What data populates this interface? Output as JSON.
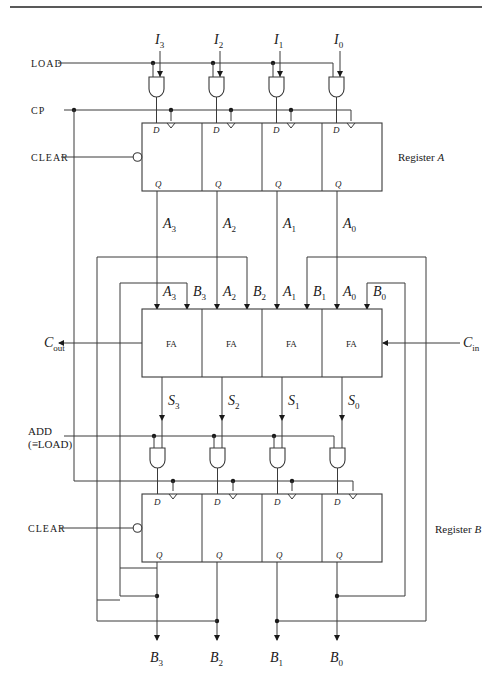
{
  "figure": {
    "top_rule": true
  },
  "inputs": {
    "I3": {
      "base": "I",
      "sub": "3"
    },
    "I2": {
      "base": "I",
      "sub": "2"
    },
    "I1": {
      "base": "I",
      "sub": "1"
    },
    "I0": {
      "base": "I",
      "sub": "0"
    }
  },
  "control": {
    "load": "LOAD",
    "cp": "CP",
    "clear_a": "CLEAR",
    "clear_b": "CLEAR",
    "add_line1": "ADD",
    "add_line2": "(≡LOAD)"
  },
  "register_a": {
    "label": "Register A",
    "label_prefix": "Register ",
    "label_var": "A",
    "pin_d": "D",
    "pin_q": "Q",
    "outputs": [
      {
        "base": "A",
        "sub": "3"
      },
      {
        "base": "A",
        "sub": "2"
      },
      {
        "base": "A",
        "sub": "1"
      },
      {
        "base": "A",
        "sub": "0"
      }
    ]
  },
  "adder": {
    "cell_label": "FA",
    "cells": [
      "FA",
      "FA",
      "FA",
      "FA"
    ],
    "a_inputs": [
      {
        "base": "A",
        "sub": "3"
      },
      {
        "base": "A",
        "sub": "2"
      },
      {
        "base": "A",
        "sub": "1"
      },
      {
        "base": "A",
        "sub": "0"
      }
    ],
    "b_inputs": [
      {
        "base": "B",
        "sub": "3"
      },
      {
        "base": "B",
        "sub": "2"
      },
      {
        "base": "B",
        "sub": "1"
      },
      {
        "base": "B",
        "sub": "0"
      }
    ],
    "carry_out": {
      "base": "C",
      "sub": "out"
    },
    "carry_in": {
      "base": "C",
      "sub": "in"
    },
    "sums": [
      {
        "base": "S",
        "sub": "3"
      },
      {
        "base": "S",
        "sub": "2"
      },
      {
        "base": "S",
        "sub": "1"
      },
      {
        "base": "S",
        "sub": "0"
      }
    ]
  },
  "register_b": {
    "label": "Register B",
    "label_prefix": "Register ",
    "label_var": "B",
    "pin_d": "D",
    "pin_q": "Q",
    "outputs": [
      {
        "base": "B",
        "sub": "3"
      },
      {
        "base": "B",
        "sub": "2"
      },
      {
        "base": "B",
        "sub": "1"
      },
      {
        "base": "B",
        "sub": "0"
      }
    ]
  }
}
